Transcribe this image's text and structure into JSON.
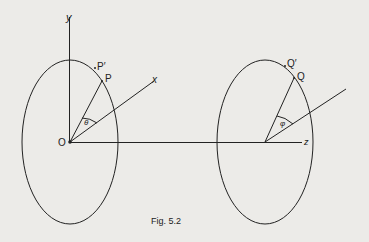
{
  "figure": {
    "caption": "Fig. 5.2",
    "left_circle": {
      "origin_label": "O",
      "y_axis_label": "y",
      "x_axis_label": "x",
      "point_label": "P",
      "point_prime_label": "P′",
      "angle_label": "θ"
    },
    "right_circle": {
      "z_axis_label": "z",
      "point_label": "Q",
      "point_prime_label": "Q′",
      "angle_label": "φ"
    },
    "colors": {
      "background": "#ecebe8",
      "stroke": "#222222"
    }
  }
}
